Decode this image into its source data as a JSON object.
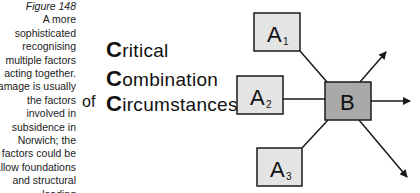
{
  "caption": {
    "figure_label": "Figure 148",
    "lines": [
      "A more",
      "sophisticated",
      "recognising",
      "multiple factors",
      "acting together.",
      "Damage is usually",
      "the factors",
      "involved in",
      "subsidence in",
      "Norwich; the",
      "factors could be",
      "shallow foundations",
      "and structural",
      "loading"
    ]
  },
  "phrase": {
    "line1": {
      "initial": "C",
      "rest": "ritical"
    },
    "line2": {
      "initial": "C",
      "rest": "ombination"
    },
    "connector": "of",
    "line3": {
      "initial": "C",
      "rest": "ircumstances"
    }
  },
  "diagram": {
    "nodes": [
      {
        "id": "A1",
        "letter": "A",
        "sub": "1",
        "fill": "#e4e4e4"
      },
      {
        "id": "A2",
        "letter": "A",
        "sub": "2",
        "fill": "#e4e4e4"
      },
      {
        "id": "A3",
        "letter": "A",
        "sub": "3",
        "fill": "#e4e4e4"
      },
      {
        "id": "B",
        "letter": "B",
        "sub": "",
        "fill": "#a9a9a9"
      }
    ],
    "edges": [
      {
        "from": "A1",
        "to": "B",
        "arrow": false
      },
      {
        "from": "A2",
        "to": "B",
        "arrow": false
      },
      {
        "from": "A3",
        "to": "B",
        "arrow": false
      },
      {
        "from": "B",
        "to": "out-upper-right",
        "arrow": true
      },
      {
        "from": "B",
        "to": "out-right",
        "arrow": true
      },
      {
        "from": "B",
        "to": "out-lower-right",
        "arrow": true
      }
    ],
    "colors": {
      "stroke": "#1a1a1a",
      "input_fill": "#e4e4e4",
      "output_fill": "#a9a9a9"
    }
  }
}
